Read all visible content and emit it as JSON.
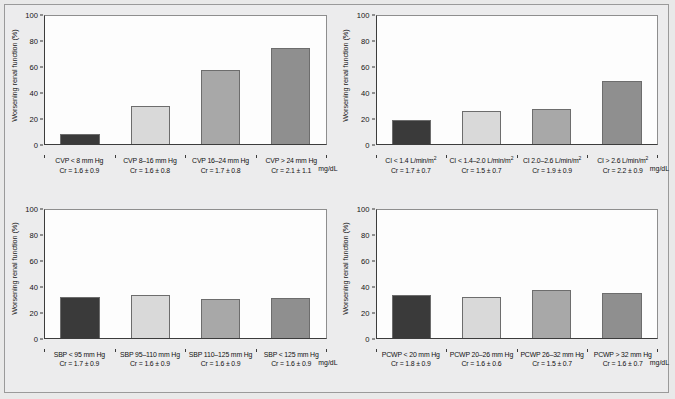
{
  "figure": {
    "background_color": "#ececed",
    "panel_background": "#fdfdfd",
    "border_color": "#9a9a9a"
  },
  "bar_colors": [
    "#3a3a3a",
    "#d9d9d9",
    "#a8a8a8",
    "#8f8f8f"
  ],
  "axis": {
    "y_label": "Worsening renal function (%)",
    "y_ticks": [
      "100",
      "80",
      "60",
      "40",
      "20",
      "0"
    ],
    "y_min": 0,
    "y_max": 100,
    "unit_label": "mg/dL"
  },
  "chart_data": [
    {
      "type": "bar",
      "panel": "top-left",
      "title": "",
      "xlabel": "",
      "ylabel": "Worsening renal function (%)",
      "ylim": [
        0,
        100
      ],
      "grid": false,
      "unit": "mg/dL",
      "categories": [
        "CVP < 8 mm Hg",
        "CVP 8–16 mm Hg",
        "CVP 16–24 mm Hg",
        "CVP > 24 mm Hg"
      ],
      "sublabels": [
        "Cr = 1.6 ± 0.9",
        "Cr = 1.6 ± 0.8",
        "Cr = 1.7 ± 0.8",
        "Cr = 2.1 ± 1.1"
      ],
      "values": [
        8,
        30,
        58,
        75
      ]
    },
    {
      "type": "bar",
      "panel": "top-right",
      "title": "",
      "xlabel": "",
      "ylabel": "Worsening renal function (%)",
      "ylim": [
        0,
        100
      ],
      "grid": false,
      "unit": "mg/dL",
      "categories": [
        "CI < 1.4 L/min/m²",
        "CI < 1.4–2.0 L/min/m²",
        "CI 2.0–2.6 L/min/m²",
        "CI > 2.6 L/min/m²"
      ],
      "sublabels": [
        "Cr = 1.7 ± 0.7",
        "Cr = 1.5 ± 0.7",
        "Cr = 1.9 ± 0.9",
        "Cr = 2.2 ± 0.9"
      ],
      "values": [
        19,
        26,
        27,
        49
      ]
    },
    {
      "type": "bar",
      "panel": "bottom-left",
      "title": "",
      "xlabel": "",
      "ylabel": "Worsening renal function (%)",
      "ylim": [
        0,
        100
      ],
      "grid": false,
      "unit": "mg/dL",
      "categories": [
        "SBP < 95 mm Hg",
        "SBP 95–110 mm Hg",
        "SBP 110–125 mm Hg",
        "SBP < 125 mm Hg"
      ],
      "sublabels": [
        "Cr = 1.7 ± 0.9",
        "Cr = 1.6 ± 0.9",
        "Cr = 1.6 ± 0.9",
        "Cr = 1.6 ± 0.9"
      ],
      "values": [
        32,
        33,
        30,
        31
      ]
    },
    {
      "type": "bar",
      "panel": "bottom-right",
      "title": "",
      "xlabel": "",
      "ylabel": "Worsening renal function (%)",
      "ylim": [
        0,
        100
      ],
      "grid": false,
      "unit": "mg/dL",
      "categories": [
        "PCWP < 20 mm Hg",
        "PCWP 20–26 mm Hg",
        "PCWP 26–32 mm Hg",
        "PCWP > 32 mm Hg"
      ],
      "sublabels": [
        "Cr = 1.8 ± 0.9",
        "Cr = 1.6 ± 0.6",
        "Cr = 1.5 ± 0.7",
        "Cr = 1.6 ± 0.7"
      ],
      "values": [
        33,
        32,
        37,
        35
      ]
    }
  ]
}
